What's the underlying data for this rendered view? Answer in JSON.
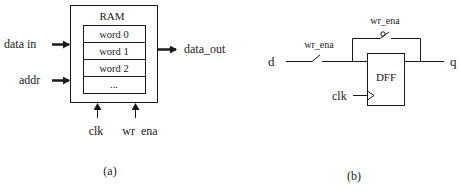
{
  "panel_a": {
    "caption": "(a)",
    "block_title": "RAM",
    "words": [
      "word 0",
      "word 1",
      "word 2",
      "..."
    ],
    "inputs": {
      "data_in": "data  in",
      "addr": "addr"
    },
    "output": "data_out",
    "bottom_inputs": {
      "clk": "clk",
      "wr_ena": "wr  ena"
    }
  },
  "panel_b": {
    "caption": "(b)",
    "input_d": "d",
    "output_q": "q",
    "switch_in_label": "wr_ena",
    "switch_feedback_label": "wr_ena",
    "flipflop_label": "DFF",
    "clock_label": "clk"
  },
  "colors": {
    "stroke": "#1a1a1a",
    "background": "#ffffff"
  }
}
